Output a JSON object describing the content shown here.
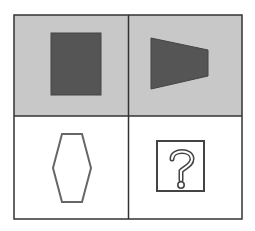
{
  "puzzle": {
    "colors": {
      "cell_shaded": "#c8c8c8",
      "cell_white": "#ffffff",
      "shape_fill": "#555555",
      "stroke": "#333333",
      "outline_shape": "#666666"
    },
    "cells": [
      {
        "position": "top-left",
        "shape": "filled-rectangle",
        "background": "gray"
      },
      {
        "position": "top-right",
        "shape": "filled-trapezoid",
        "background": "gray"
      },
      {
        "position": "bottom-left",
        "shape": "outline-hexagon",
        "background": "white"
      },
      {
        "position": "bottom-right",
        "shape": "question-mark-box",
        "background": "white"
      }
    ],
    "question_mark": "?"
  }
}
